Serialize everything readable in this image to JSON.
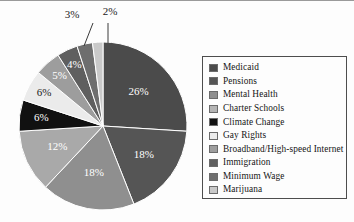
{
  "chart_data": {
    "type": "pie",
    "title": "",
    "legend_position": "right",
    "categories": [
      "Medicaid",
      "Pensions",
      "Mental Health",
      "Charter Schools",
      "Climate Change",
      "Gay Rights",
      "Broadband/High-speed Internet",
      "Immigration",
      "Minimum Wage",
      "Marijuana"
    ],
    "values": [
      26,
      18,
      18,
      12,
      6,
      6,
      5,
      4,
      3,
      2
    ],
    "value_labels": [
      "26%",
      "18%",
      "18%",
      "12%",
      "6%",
      "6%",
      "5%",
      "4%",
      "3%",
      "2%"
    ],
    "colors": [
      "#4b4b4b",
      "#555555",
      "#8f8f8f",
      "#a9a9a9",
      "#111111",
      "#ebebeb",
      "#9d9d9d",
      "#5f5f5f",
      "#6e6e6e",
      "#c9c9c9"
    ],
    "label_text_colors": [
      "#ffffff",
      "#ffffff",
      "#ffffff",
      "#ffffff",
      "#ffffff",
      "#1a1a1a",
      "#ffffff",
      "#ffffff",
      "#1a1a1a",
      "#1a1a1a"
    ],
    "callout_labels": [
      "3%",
      "2%"
    ],
    "xlabel": "",
    "ylabel": ""
  },
  "legend": {
    "items": [
      {
        "label": "Medicaid",
        "color": "#4b4b4b"
      },
      {
        "label": "Pensions",
        "color": "#555555"
      },
      {
        "label": "Mental Health",
        "color": "#8f8f8f"
      },
      {
        "label": "Charter Schools",
        "color": "#b4b4b4"
      },
      {
        "label": "Climate Change",
        "color": "#111111"
      },
      {
        "label": "Gay Rights",
        "color": "#ececec"
      },
      {
        "label": "Broadband/High-speed Internet",
        "color": "#9d9d9d"
      },
      {
        "label": "Immigration",
        "color": "#5f5f5f"
      },
      {
        "label": "Minimum Wage",
        "color": "#6e6e6e"
      },
      {
        "label": "Marijuana",
        "color": "#c9c9c9"
      }
    ]
  },
  "slice_labels": {
    "medicaid": "26%",
    "pensions": "18%",
    "mental_health": "18%",
    "charter_schools": "12%",
    "climate_change": "6%",
    "gay_rights": "6%",
    "broadband": "5%",
    "immigration": "4%",
    "minimum_wage": "3%",
    "marijuana": "2%"
  }
}
